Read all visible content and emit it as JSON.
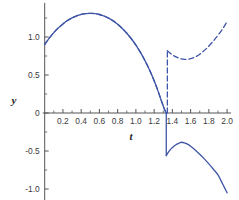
{
  "chart_data": {
    "type": "line",
    "title": "",
    "subtitle": "",
    "xlabel": "t",
    "ylabel": "y",
    "xlim": [
      0.0,
      2.0
    ],
    "ylim": [
      -1.15,
      1.45
    ],
    "grid": false,
    "legend": null,
    "legend_position": "none",
    "axis_color": "#555555",
    "curve_color": "#3f55a6",
    "x_ticks": [
      0.2,
      0.4,
      0.6,
      0.8,
      1.0,
      1.2,
      1.4,
      1.6,
      1.8,
      2.0
    ],
    "x_tick_labels": [
      "0.2",
      "0.4",
      "0.6",
      "0.8",
      "1.0",
      "1.2",
      "1.4",
      "1.6",
      "1.8",
      "2.0"
    ],
    "x_minor_ticks": [
      0.1,
      0.3,
      0.5,
      0.7,
      0.9,
      1.1,
      1.3,
      1.5,
      1.7,
      1.9
    ],
    "y_ticks": [
      -1.0,
      -0.5,
      0.0,
      0.5,
      1.0
    ],
    "y_tick_labels": [
      "-1.0",
      "-0.5",
      "0",
      "0.5",
      "1.0"
    ],
    "y_minor_ticks": [
      -0.75,
      -0.25,
      0.25,
      0.75,
      1.25
    ],
    "annotations": [
      {
        "text": "jump discontinuity",
        "x": 1.33,
        "y": 0.0
      }
    ],
    "series": [
      {
        "name": "solid-branch",
        "style": "solid",
        "color": "#3f55a6",
        "width": 1.3,
        "segments": [
          {
            "comment": "rising arc from (0,0.90) over peak (0.52,1.31) down to zero at t=1.33",
            "x": [
              0.0,
              0.05,
              0.1,
              0.15,
              0.2,
              0.25,
              0.3,
              0.35,
              0.4,
              0.45,
              0.5,
              0.55,
              0.6,
              0.65,
              0.7,
              0.75,
              0.8,
              0.85,
              0.9,
              0.95,
              1.0,
              1.05,
              1.1,
              1.15,
              1.2,
              1.24,
              1.28,
              1.31,
              1.325,
              1.332
            ],
            "y": [
              0.9,
              0.985,
              1.058,
              1.12,
              1.172,
              1.216,
              1.251,
              1.278,
              1.297,
              1.308,
              1.312,
              1.308,
              1.296,
              1.276,
              1.248,
              1.212,
              1.167,
              1.113,
              1.05,
              0.977,
              0.893,
              0.797,
              0.688,
              0.565,
              0.425,
              0.298,
              0.158,
              0.06,
              0.018,
              0.0
            ]
          },
          {
            "comment": "vertical drop at t=1.333 from 0 to -0.56",
            "x": [
              1.333,
              1.333
            ],
            "y": [
              0.0,
              -0.56
            ]
          },
          {
            "comment": "lower branch: rise to local max (1.50,-0.385) then fall to (2.00,-1.05)",
            "x": [
              1.333,
              1.36,
              1.39,
              1.42,
              1.45,
              1.48,
              1.5,
              1.53,
              1.56,
              1.6,
              1.65,
              1.7,
              1.75,
              1.8,
              1.85,
              1.9,
              1.95,
              2.0
            ],
            "y": [
              -0.56,
              -0.508,
              -0.466,
              -0.433,
              -0.409,
              -0.392,
              -0.385,
              -0.392,
              -0.407,
              -0.437,
              -0.486,
              -0.542,
              -0.603,
              -0.67,
              -0.74,
              -0.815,
              -0.93,
              -1.05
            ]
          }
        ]
      },
      {
        "name": "dashed-branch",
        "style": "dashed",
        "color": "#3f55a6",
        "width": 1.3,
        "dash": [
          5,
          3
        ],
        "segments": [
          {
            "comment": "coincides with solid arc from (0,0.90) to zero at t=1.33",
            "x": [
              0.0,
              0.05,
              0.1,
              0.15,
              0.2,
              0.25,
              0.3,
              0.35,
              0.4,
              0.45,
              0.5,
              0.55,
              0.6,
              0.65,
              0.7,
              0.75,
              0.8,
              0.85,
              0.9,
              0.95,
              1.0,
              1.05,
              1.1,
              1.15,
              1.2,
              1.24,
              1.28,
              1.31,
              1.325,
              1.332
            ],
            "y": [
              0.9,
              0.985,
              1.058,
              1.12,
              1.172,
              1.216,
              1.251,
              1.278,
              1.297,
              1.308,
              1.312,
              1.308,
              1.296,
              1.276,
              1.248,
              1.212,
              1.167,
              1.113,
              1.05,
              0.977,
              0.893,
              0.797,
              0.688,
              0.565,
              0.425,
              0.298,
              0.158,
              0.06,
              0.018,
              0.0
            ]
          },
          {
            "comment": "vertical jump at t=1.345 from 0 up to 0.82",
            "x": [
              1.345,
              1.345
            ],
            "y": [
              0.0,
              0.82
            ]
          },
          {
            "comment": "upper branch: dips to (1.55,0.705) then rises to (2.00,1.20)",
            "x": [
              1.345,
              1.38,
              1.41,
              1.44,
              1.47,
              1.5,
              1.53,
              1.55,
              1.58,
              1.62,
              1.66,
              1.7,
              1.74,
              1.78,
              1.82,
              1.86,
              1.9,
              1.94,
              1.97,
              2.0
            ],
            "y": [
              0.82,
              0.782,
              0.758,
              0.738,
              0.722,
              0.712,
              0.706,
              0.705,
              0.709,
              0.722,
              0.744,
              0.774,
              0.812,
              0.857,
              0.908,
              0.963,
              1.022,
              1.088,
              1.142,
              1.205
            ]
          }
        ]
      }
    ]
  }
}
